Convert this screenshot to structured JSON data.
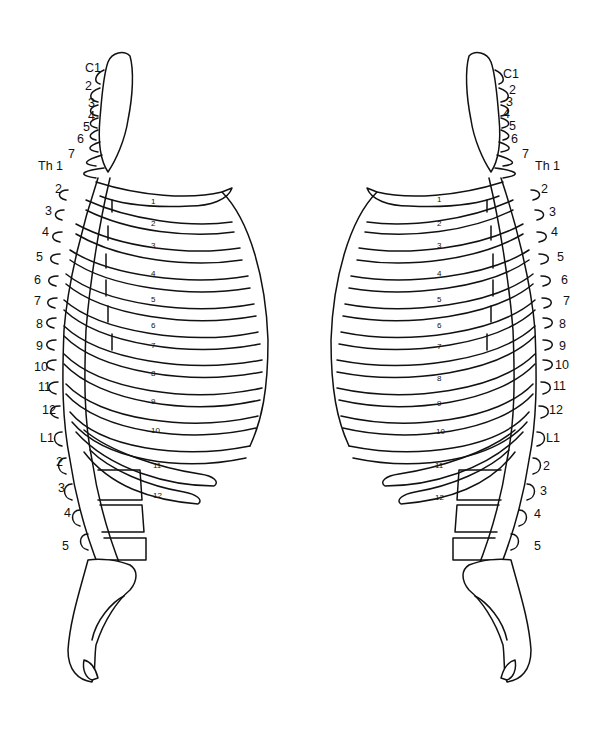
{
  "figure": {
    "line_color": "#111111",
    "background": "#ffffff"
  },
  "left_view": {
    "vertebra_labels": [
      "C1",
      "2",
      "3",
      "4",
      "5",
      "6",
      "7",
      "Th 1",
      "2",
      "3",
      "4",
      "5",
      "6",
      "7",
      "8",
      "9",
      "10",
      "11",
      "12",
      "L1",
      "2",
      "3",
      "4",
      "5"
    ],
    "rib_labels": [
      "1",
      "2",
      "3",
      "4",
      "5",
      "6",
      "7",
      "8",
      "9",
      "10",
      "11",
      "12"
    ]
  },
  "right_view": {
    "vertebra_labels": [
      "C1",
      "2",
      "3",
      "4",
      "5",
      "6",
      "7",
      "Th 1",
      "2",
      "3",
      "4",
      "5",
      "6",
      "7",
      "8",
      "9",
      "10",
      "11",
      "12",
      "L1",
      "2",
      "3",
      "4",
      "5"
    ],
    "rib_labels": [
      "1",
      "2",
      "3",
      "4",
      "5",
      "6",
      "7",
      "8",
      "9",
      "10",
      "11",
      "12"
    ]
  }
}
